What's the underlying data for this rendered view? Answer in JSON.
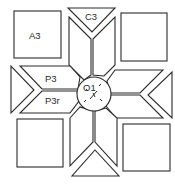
{
  "diagram": {
    "type": "quilt-block-pattern",
    "labels": {
      "corner_square": "A3",
      "edge_triangle": "C3",
      "parallelogram": "P3",
      "parallelogram_reversed": "P3r",
      "center_circle": "O1"
    },
    "colors": {
      "stroke": "#2a2a2a",
      "fill": "#ffffff"
    }
  }
}
